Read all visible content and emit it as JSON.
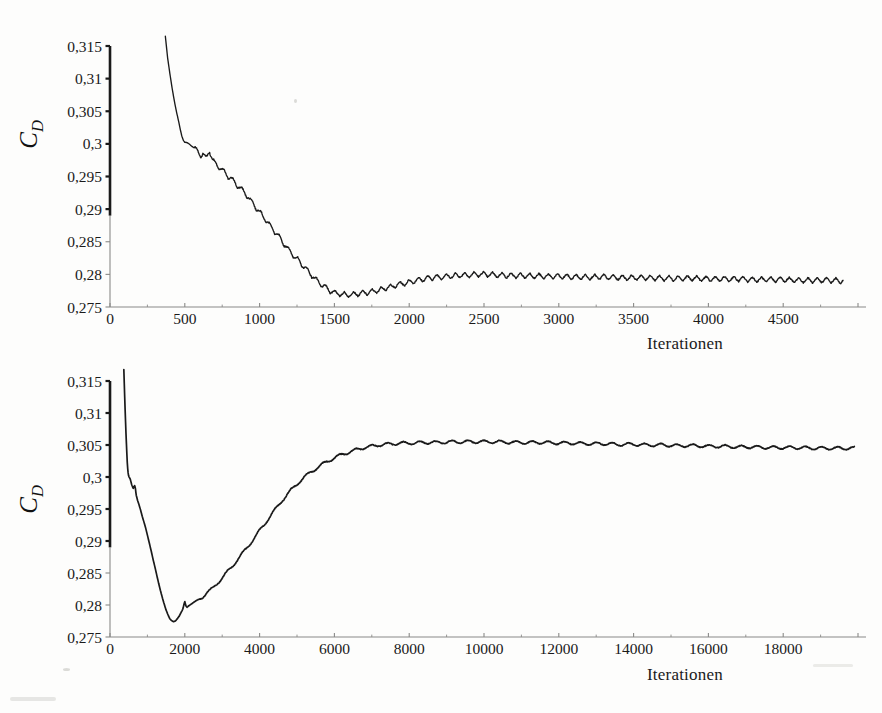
{
  "document": {
    "background_color": "#fdfdfc",
    "ink_color": "#1a1a1a",
    "axis_color": "#8a8a88"
  },
  "chart_data": [
    {
      "id": "top",
      "type": "line",
      "title": "",
      "xlabel": "Iterationen",
      "ylabel": "C_D",
      "ylabel_base": "C",
      "ylabel_sub": "D",
      "xlim": [
        0,
        5000
      ],
      "ylim": [
        0.275,
        0.315
      ],
      "xticks": [
        0,
        500,
        1000,
        1500,
        2000,
        2500,
        3000,
        3500,
        4000,
        4500
      ],
      "xtick_labels": [
        "0",
        "500",
        "1000",
        "1500",
        "2000",
        "2500",
        "3000",
        "3500",
        "4000",
        "4500"
      ],
      "yticks": [
        0.275,
        0.28,
        0.285,
        0.29,
        0.295,
        0.3,
        0.305,
        0.31,
        0.315
      ],
      "ytick_labels": [
        "0,275",
        "0,28",
        "0,285",
        "0,29",
        "0,295",
        "0,3",
        "0,305",
        "0,31",
        "0,315"
      ],
      "grid": false,
      "legend": "none",
      "series": [
        {
          "name": "C_D",
          "color": "#1a1a1a",
          "x": [
            370,
            385,
            400,
            415,
            430,
            445,
            460,
            470,
            480,
            490,
            500,
            515,
            530,
            545,
            560,
            575,
            590,
            600,
            610,
            620,
            630,
            640,
            650,
            660,
            665,
            670,
            680,
            690,
            700,
            715,
            730,
            745,
            760,
            775,
            790,
            805,
            820,
            835,
            850,
            865,
            880,
            900,
            920,
            940,
            960,
            980,
            1000,
            1020,
            1040,
            1060,
            1080,
            1100,
            1120,
            1140,
            1160,
            1180,
            1200,
            1220,
            1240,
            1260,
            1280,
            1300,
            1320,
            1340,
            1360,
            1380,
            1400,
            1420,
            1440,
            1460,
            1480,
            1500,
            1520,
            1540,
            1560,
            1580,
            1600,
            1640,
            1680,
            1720,
            1760,
            1800,
            1840,
            1880,
            1920,
            1960,
            2000,
            2050,
            2100,
            2150,
            2200,
            2250,
            2300,
            2350,
            2400,
            2450,
            2500,
            2600,
            2700,
            2800,
            2900,
            3000,
            3100,
            3200,
            3300,
            3400,
            3500,
            3600,
            3700,
            3800,
            3900,
            4000,
            4100,
            4200,
            4300,
            4400,
            4500,
            4600,
            4700,
            4800,
            4900
          ],
          "y": [
            0.3165,
            0.3132,
            0.3108,
            0.3086,
            0.3066,
            0.3048,
            0.3033,
            0.3022,
            0.3013,
            0.3006,
            0.3002,
            0.3001,
            0.3,
            0.2998,
            0.2994,
            0.2991,
            0.2988,
            0.2985,
            0.2982,
            0.2985,
            0.2981,
            0.2978,
            0.2982,
            0.2988,
            0.2991,
            0.2986,
            0.2979,
            0.2974,
            0.297,
            0.2968,
            0.2964,
            0.2961,
            0.2957,
            0.2955,
            0.295,
            0.2948,
            0.2944,
            0.2941,
            0.2936,
            0.2934,
            0.293,
            0.2925,
            0.292,
            0.2913,
            0.2908,
            0.2901,
            0.2896,
            0.289,
            0.2884,
            0.2878,
            0.2872,
            0.2866,
            0.286,
            0.2854,
            0.2848,
            0.2842,
            0.2836,
            0.2831,
            0.2826,
            0.2821,
            0.2816,
            0.2811,
            0.2806,
            0.2801,
            0.2796,
            0.2791,
            0.2787,
            0.2783,
            0.278,
            0.2777,
            0.2774,
            0.2772,
            0.2771,
            0.277,
            0.2769,
            0.2769,
            0.2769,
            0.277,
            0.2771,
            0.2772,
            0.2774,
            0.2776,
            0.2779,
            0.2781,
            0.2784,
            0.2786,
            0.2788,
            0.2791,
            0.2793,
            0.2795,
            0.2796,
            0.2797,
            0.2798,
            0.2799,
            0.2799,
            0.28,
            0.28,
            0.2799,
            0.2798,
            0.2798,
            0.2797,
            0.2797,
            0.2796,
            0.2796,
            0.2796,
            0.2795,
            0.2795,
            0.2795,
            0.2794,
            0.2794,
            0.2794,
            0.2793,
            0.2793,
            0.2793,
            0.2792,
            0.2792,
            0.2792,
            0.2791,
            0.2791,
            0.2791,
            0.279
          ],
          "oscillation": {
            "description": "high-frequency saw-tooth ripple superimposed on the mean trend",
            "amplitude": 0.0004,
            "period_iterations": 62
          },
          "annotations": [
            {
              "label": "steep initial drop",
              "x": 430,
              "y": 0.3066
            },
            {
              "label": "knee",
              "x": 500,
              "y": 0.3002
            },
            {
              "label": "local bump",
              "x": 665,
              "y": 0.2991
            },
            {
              "label": "minimum",
              "x": 1520,
              "y": 0.2755
            },
            {
              "label": "plateau",
              "x": 3000,
              "y": 0.2797
            }
          ]
        }
      ]
    },
    {
      "id": "bottom",
      "type": "line",
      "title": "",
      "xlabel": "Iterationen",
      "ylabel": "C_D",
      "ylabel_base": "C",
      "ylabel_sub": "D",
      "xlim": [
        0,
        20000
      ],
      "ylim": [
        0.275,
        0.315
      ],
      "xticks": [
        0,
        2000,
        4000,
        6000,
        8000,
        10000,
        12000,
        14000,
        16000,
        18000
      ],
      "xtick_labels": [
        "0",
        "2000",
        "4000",
        "6000",
        "8000",
        "10000",
        "12000",
        "14000",
        "16000",
        "18000"
      ],
      "yticks": [
        0.275,
        0.28,
        0.285,
        0.29,
        0.295,
        0.3,
        0.305,
        0.31,
        0.315
      ],
      "ytick_labels": [
        "0,275",
        "0,28",
        "0,285",
        "0,29",
        "0,295",
        "0,3",
        "0,305",
        "0,31",
        "0,315"
      ],
      "grid": false,
      "legend": "none",
      "series": [
        {
          "name": "C_D",
          "color": "#1a1a1a",
          "x": [
            370,
            400,
            430,
            460,
            480,
            500,
            540,
            580,
            620,
            660,
            680,
            700,
            740,
            780,
            820,
            860,
            900,
            950,
            1000,
            1050,
            1100,
            1150,
            1200,
            1250,
            1300,
            1350,
            1400,
            1450,
            1500,
            1550,
            1600,
            1650,
            1700,
            1750,
            1800,
            1850,
            1900,
            1950,
            1980,
            2000,
            2030,
            2060,
            2100,
            2200,
            2300,
            2400,
            2500,
            2600,
            2700,
            2800,
            2900,
            3000,
            3200,
            3400,
            3600,
            3800,
            4000,
            4200,
            4400,
            4600,
            4800,
            5000,
            5200,
            5400,
            5600,
            5800,
            6000,
            6200,
            6400,
            6600,
            6800,
            7000,
            7200,
            7400,
            7600,
            7800,
            8000,
            8400,
            8800,
            9200,
            9600,
            10000,
            10400,
            10800,
            11200,
            11600,
            12000,
            12400,
            12800,
            13200,
            13600,
            14000,
            14400,
            14800,
            15200,
            15600,
            16000,
            16400,
            16800,
            17200,
            17600,
            18000,
            18400,
            18800,
            19200,
            19600,
            19900
          ],
          "y": [
            0.3168,
            0.3112,
            0.3064,
            0.3024,
            0.3008,
            0.3001,
            0.2997,
            0.2988,
            0.2982,
            0.2987,
            0.2982,
            0.2972,
            0.2963,
            0.2956,
            0.2948,
            0.2939,
            0.2931,
            0.2921,
            0.2909,
            0.2897,
            0.2885,
            0.2872,
            0.286,
            0.2847,
            0.2834,
            0.2822,
            0.2811,
            0.2801,
            0.2792,
            0.2785,
            0.2779,
            0.2776,
            0.2774,
            0.2775,
            0.2778,
            0.2782,
            0.2788,
            0.2794,
            0.2802,
            0.2806,
            0.2799,
            0.2797,
            0.2799,
            0.2802,
            0.2806,
            0.281,
            0.2814,
            0.2819,
            0.2824,
            0.283,
            0.2836,
            0.2842,
            0.2856,
            0.287,
            0.2885,
            0.29,
            0.2916,
            0.2932,
            0.2948,
            0.2963,
            0.2977,
            0.2989,
            0.3,
            0.3009,
            0.3017,
            0.3024,
            0.303,
            0.3035,
            0.3039,
            0.3043,
            0.3046,
            0.3048,
            0.305,
            0.3051,
            0.3052,
            0.3053,
            0.3053,
            0.3054,
            0.3054,
            0.3055,
            0.3055,
            0.3055,
            0.3055,
            0.3054,
            0.3054,
            0.3054,
            0.3053,
            0.3053,
            0.3052,
            0.3052,
            0.3051,
            0.3051,
            0.305,
            0.305,
            0.3049,
            0.3049,
            0.3048,
            0.3048,
            0.3047,
            0.3047,
            0.3046,
            0.3046,
            0.3046,
            0.3045,
            0.3045,
            0.3045,
            0.3045
          ],
          "oscillation": {
            "description": "small ripple visible on the converged plateau",
            "amplitude": 0.00022,
            "period_iterations": 430
          },
          "annotations": [
            {
              "label": "steep initial drop",
              "x": 430,
              "y": 0.3064
            },
            {
              "label": "minimum",
              "x": 1700,
              "y": 0.2754
            },
            {
              "label": "notch / bump",
              "x": 2000,
              "y": 0.2806
            },
            {
              "label": "rise to converged value",
              "x": 5000,
              "y": 0.2989
            },
            {
              "label": "converged plateau",
              "x": 11000,
              "y": 0.3055
            },
            {
              "label": "end value",
              "x": 19900,
              "y": 0.3045
            }
          ]
        }
      ]
    }
  ]
}
